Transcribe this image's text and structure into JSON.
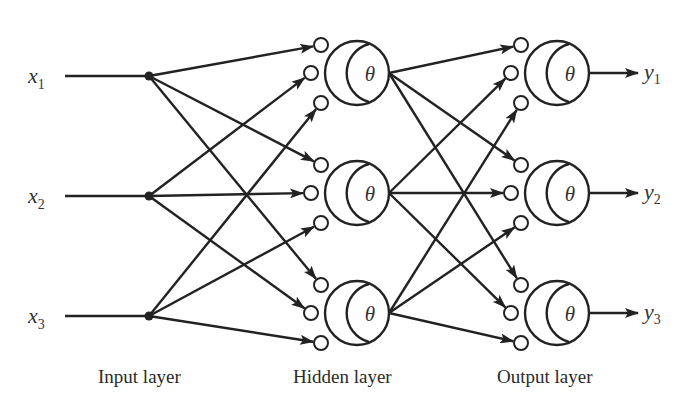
{
  "diagram": {
    "type": "feedforward-neural-network",
    "inputs": [
      {
        "label": "x",
        "sub": "1"
      },
      {
        "label": "x",
        "sub": "2"
      },
      {
        "label": "x",
        "sub": "3"
      }
    ],
    "hidden_neurons": [
      {
        "symbol": "θ"
      },
      {
        "symbol": "θ"
      },
      {
        "symbol": "θ"
      }
    ],
    "output_neurons": [
      {
        "symbol": "θ"
      },
      {
        "symbol": "θ"
      },
      {
        "symbol": "θ"
      }
    ],
    "outputs": [
      {
        "label": "y",
        "sub": "1"
      },
      {
        "label": "y",
        "sub": "2"
      },
      {
        "label": "y",
        "sub": "3"
      }
    ],
    "layer_labels": {
      "input": "Input layer",
      "hidden": "Hidden layer",
      "output": "Output layer"
    },
    "colors": {
      "stroke": "#222222",
      "text": "#333333",
      "background": "#ffffff"
    }
  }
}
